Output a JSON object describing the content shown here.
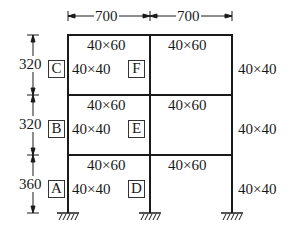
{
  "diagram": {
    "type": "plane-frame",
    "colors": {
      "line": "#1a1a1a",
      "background": "#ffffff"
    },
    "spans": {
      "left": "700",
      "right": "700"
    },
    "story_heights": {
      "top": "320",
      "middle": "320",
      "bottom": "360"
    },
    "beams": {
      "top_left": "40×60",
      "top_right": "40×60",
      "mid_left": "40×60",
      "mid_right": "40×60",
      "bot_left": "40×60",
      "bot_right": "40×60"
    },
    "columns": {
      "top_left": "40×40",
      "mid_left": "40×40",
      "bot_left": "40×40",
      "top_right": "40×40",
      "mid_right": "40×40",
      "bot_right": "40×40"
    },
    "nodes": {
      "A": "A",
      "B": "B",
      "C": "C",
      "D": "D",
      "E": "E",
      "F": "F"
    },
    "supports": [
      "fixed",
      "fixed",
      "fixed"
    ]
  }
}
